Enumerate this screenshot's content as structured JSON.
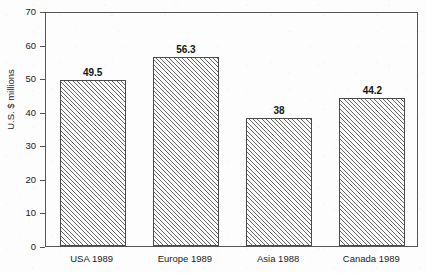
{
  "chart_data": {
    "type": "bar",
    "title": "",
    "xlabel": "",
    "ylabel": "U.S. $ millions",
    "categories": [
      "USA 1989",
      "Europe 1989",
      "Asia 1988",
      "Canada 1989"
    ],
    "values": [
      49.5,
      56.3,
      38,
      44.2
    ],
    "value_labels": [
      "49.5",
      "56.3",
      "38",
      "44.2"
    ],
    "ylim": [
      0,
      70
    ],
    "ytick_step": 10,
    "yticks": [
      0,
      10,
      20,
      30,
      40,
      50,
      60,
      70
    ],
    "ytick_labels": [
      "0",
      "10",
      "20",
      "30",
      "40",
      "50",
      "60",
      "70"
    ],
    "grid": false,
    "legend": false,
    "legend_position": "none",
    "bar_fill": "diagonal-hatch",
    "bar_edge_color": "#4a4a4a",
    "axis_color": "#555555",
    "text_color": "#1a1a1a",
    "background_color": "#fdfdfd"
  },
  "figure": {
    "clipped_title": "",
    "y_axis_title": "U.S. $ millions"
  }
}
